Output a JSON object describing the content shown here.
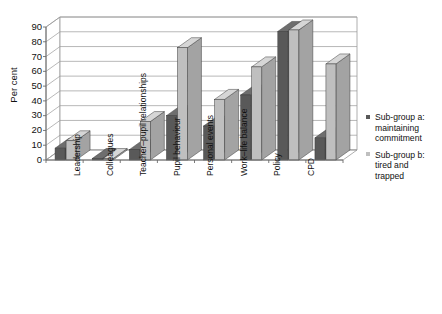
{
  "chart_data": {
    "type": "bar",
    "title": "",
    "subtitle": "",
    "xlabel": "",
    "ylabel": "Per cent",
    "ylim": [
      0,
      90
    ],
    "ytick_values": [
      0,
      10,
      20,
      30,
      40,
      50,
      60,
      70,
      80,
      90
    ],
    "grid": true,
    "legend_position": "right",
    "style": "3d-grouped-column",
    "categories": [
      "Leadership",
      "Colleagues",
      "Teacher–pupil relationships",
      "Pupil behaviour",
      "Personal events",
      "Work–life balance",
      "Policy",
      "CPD"
    ],
    "series": [
      {
        "name": "Sub-group a: maintaining commitment",
        "color": "#595959",
        "values": [
          8,
          1,
          7,
          30,
          23,
          44,
          87,
          15
        ]
      },
      {
        "name": "Sub-group b: tired and trapped",
        "color": "#bfbfbf",
        "values": [
          13,
          1,
          26,
          76,
          41,
          63,
          88,
          65
        ]
      }
    ]
  },
  "axis": {
    "y_title": "Per cent",
    "y_ticks": [
      "90",
      "80",
      "70",
      "60",
      "50",
      "40",
      "30",
      "20",
      "10",
      "0"
    ]
  },
  "legend": {
    "items": [
      {
        "marker": "square-marker",
        "lines": [
          "Sub-group a:",
          "maintaining",
          "commitment"
        ],
        "color": "#595959"
      },
      {
        "marker": "square-marker",
        "lines": [
          "Sub-group b:",
          "tired and",
          "trapped"
        ],
        "color": "#bfbfbf"
      }
    ]
  }
}
